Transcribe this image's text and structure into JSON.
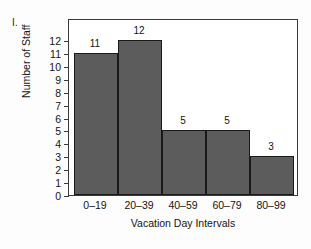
{
  "item_label": "I.",
  "chart_data": {
    "type": "bar",
    "title": "",
    "xlabel": "Vacation Day Intervals",
    "ylabel": "Number of Staff",
    "categories": [
      "0–19",
      "20–39",
      "40–59",
      "60–79",
      "80–99"
    ],
    "values": [
      11,
      12,
      5,
      5,
      3
    ],
    "value_labels": [
      "11",
      "12",
      "5",
      "5",
      "3"
    ],
    "ylim": [
      0,
      12
    ],
    "ytick_labels": [
      "0",
      "1",
      "2",
      "3",
      "4",
      "5",
      "6",
      "7",
      "8",
      "9",
      "10",
      "11",
      "12"
    ],
    "ytick_values": [
      0,
      1,
      2,
      3,
      4,
      5,
      6,
      7,
      8,
      9,
      10,
      11,
      12
    ],
    "grid": false,
    "legend": false,
    "bar_fill_color": "#5c5c5c",
    "bar_edge_color": "#1a1a1a",
    "axis_color": "#3a3a3a",
    "background_color": "#ffffff"
  }
}
